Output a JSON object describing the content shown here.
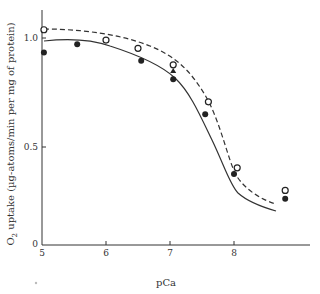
{
  "chart_data": {
    "type": "scatter",
    "title": "",
    "xlabel": "pCa",
    "ylabel": "O2 uptake (µg-atoms/min per mg of protein)",
    "xlim": [
      5,
      9
    ],
    "ylim": [
      0,
      1.15
    ],
    "x_ticks": [
      "5",
      "6",
      "7",
      "8"
    ],
    "y_ticks": [
      "0",
      "0.5",
      "1.0"
    ],
    "grid": false,
    "legend": null,
    "series": [
      {
        "name": "open-circles",
        "marker": "open-circle",
        "line": "dashed",
        "x": [
          5.03,
          6.0,
          6.5,
          7.05,
          7.6,
          8.05,
          8.8
        ],
        "y": [
          1.04,
          0.99,
          0.95,
          0.87,
          0.69,
          0.37,
          0.26
        ]
      },
      {
        "name": "filled-circles",
        "marker": "filled-circle",
        "line": "solid",
        "x": [
          5.03,
          5.55,
          6.55,
          7.05,
          7.55,
          8.0,
          8.8
        ],
        "y": [
          0.93,
          0.97,
          0.89,
          0.8,
          0.63,
          0.34,
          0.22
        ]
      },
      {
        "name": "triangle",
        "marker": "filled-triangle",
        "line": "none",
        "x": [
          7.05
        ],
        "y": [
          0.84
        ]
      }
    ]
  },
  "labels": {
    "xlabel": "pCa",
    "ylabel_prefix": "O",
    "ylabel_sub": "2",
    "ylabel_rest": " uptake (µg-atoms/min per mg of protein)",
    "x_ticks": [
      "5",
      "6",
      "7",
      "8"
    ],
    "y_ticks": [
      "0",
      "0.5",
      "1.0"
    ]
  }
}
